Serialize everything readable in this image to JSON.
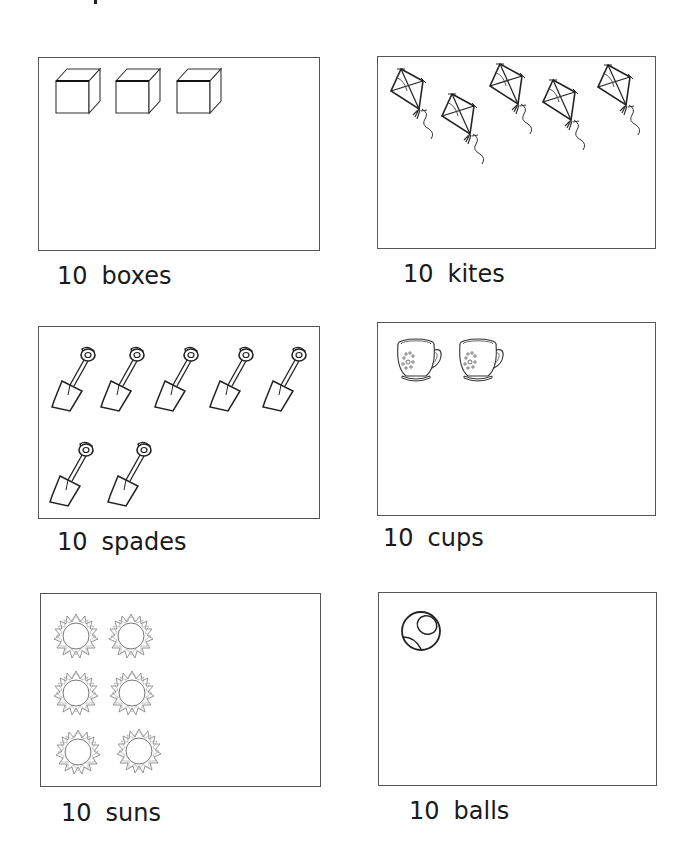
{
  "worksheet": {
    "panels": [
      {
        "id": "boxes",
        "count_label": "10",
        "noun": "boxes",
        "icon": "cube-icon",
        "drawn": 3
      },
      {
        "id": "kites",
        "count_label": "10",
        "noun": "kites",
        "icon": "kite-icon",
        "drawn": 5
      },
      {
        "id": "spades",
        "count_label": "10",
        "noun": "spades",
        "icon": "spade-icon",
        "drawn": 7
      },
      {
        "id": "cups",
        "count_label": "10",
        "noun": "cups",
        "icon": "cup-icon",
        "drawn": 2
      },
      {
        "id": "suns",
        "count_label": "10",
        "noun": "suns",
        "icon": "sun-icon",
        "drawn": 6
      },
      {
        "id": "balls",
        "count_label": "10",
        "noun": "balls",
        "icon": "ball-icon",
        "drawn": 1
      }
    ]
  },
  "colors": {
    "ink": "#1a1a1a",
    "border": "#555555",
    "sun_line": "#888888"
  }
}
